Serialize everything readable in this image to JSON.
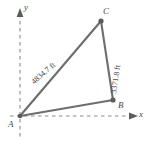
{
  "figure": {
    "type": "geometry-diagram",
    "background_color": "#ffffff",
    "line_color": "#6e6e6e",
    "axis_color": "#8c8c8c",
    "text_color": "#3d3d3d"
  },
  "axes": {
    "x_label": "x",
    "y_label": "y",
    "style": "dashed",
    "origin_label": "A"
  },
  "vertices": [
    {
      "name": "A",
      "label": "A",
      "x": 20,
      "y": 116,
      "marker": false
    },
    {
      "name": "B",
      "label": "B",
      "x": 113,
      "y": 100,
      "marker": true
    },
    {
      "name": "C",
      "label": "C",
      "x": 101,
      "y": 21,
      "marker": true
    }
  ],
  "sides": [
    {
      "name": "AC",
      "label": "4834.7 ft",
      "value": 4834.7,
      "unit": "ft",
      "from": "A",
      "to": "C"
    },
    {
      "name": "BC",
      "label": "3371.8 ft",
      "value": 3371.8,
      "unit": "ft",
      "from": "B",
      "to": "C"
    },
    {
      "name": "AB",
      "label": "",
      "from": "A",
      "to": "B"
    }
  ]
}
